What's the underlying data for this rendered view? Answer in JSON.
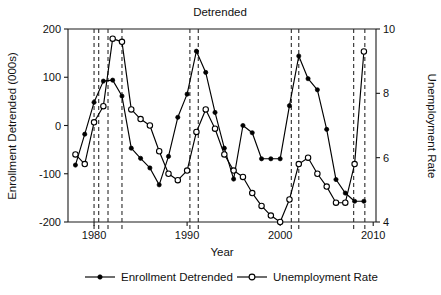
{
  "chart_data": {
    "type": "line",
    "title": "Detrended",
    "xlabel": "Year",
    "ylabel": "Enrollment Detrended (000s)",
    "y2label": "Unemployment Rate",
    "xlim": [
      1977.2,
      2010.3
    ],
    "ylim": [
      -200,
      200
    ],
    "y2lim": [
      4,
      10
    ],
    "grid": false,
    "legend_position": "below",
    "xticks": [
      1980,
      1990,
      2000,
      2010
    ],
    "xticklabels": [
      "1980",
      "1990",
      "2000",
      "2010"
    ],
    "yticks": [
      -200,
      -100,
      0,
      100,
      200
    ],
    "yticklabels": [
      "-200",
      "-100",
      "0",
      "100",
      "200"
    ],
    "y2ticks": [
      4,
      6,
      8,
      10
    ],
    "y2ticklabels": [
      "4",
      "6",
      "8",
      "10"
    ],
    "annotations": {
      "recession_lines_label": "recession markers (dashed vertical)",
      "recession_years": [
        1980.0,
        1980.5,
        1981.5,
        1983.0,
        1990.3,
        1991.2,
        2001.2,
        2002.0,
        2007.9,
        2009.1
      ]
    },
    "series": [
      {
        "name": "Enrollment Detrended",
        "axis": "left",
        "marker": "filled-circle",
        "x": [
          1978,
          1979,
          1980,
          1981,
          1982,
          1983,
          1984,
          1985,
          1986,
          1987,
          1988,
          1989,
          1990,
          1991,
          1992,
          1993,
          1994,
          1995,
          1996,
          1997,
          1998,
          1999,
          2000,
          2001,
          2002,
          2003,
          2004,
          2005,
          2006,
          2007,
          2008,
          2009
        ],
        "values": [
          -82,
          -18,
          48,
          92,
          94,
          61,
          -47,
          -68,
          -88,
          -123,
          -64,
          17,
          65,
          154,
          110,
          27,
          -47,
          -111,
          0,
          -15,
          -69,
          -69,
          -69,
          41,
          144,
          97,
          74,
          -8,
          -112,
          -140,
          -157,
          -157
        ]
      },
      {
        "name": "Unemployment Rate",
        "axis": "right",
        "marker": "open-circle",
        "x": [
          1978,
          1979,
          1980,
          1981,
          1982,
          1983,
          1984,
          1985,
          1986,
          1987,
          1988,
          1989,
          1990,
          1991,
          1992,
          1993,
          1994,
          1995,
          1996,
          1997,
          1998,
          1999,
          2000,
          2001,
          2002,
          2003,
          2004,
          2005,
          2006,
          2007,
          2008,
          2009
        ],
        "values": [
          6.1,
          5.8,
          7.1,
          7.6,
          9.7,
          9.6,
          7.5,
          7.2,
          7.0,
          6.2,
          5.5,
          5.3,
          5.6,
          6.8,
          7.5,
          6.9,
          6.1,
          5.6,
          5.4,
          4.9,
          4.5,
          4.2,
          4.0,
          4.7,
          5.8,
          6.0,
          5.5,
          5.1,
          4.6,
          4.6,
          5.8,
          9.3
        ]
      }
    ],
    "legend": [
      {
        "label": "Enrollment Detrended",
        "marker": "filled-circle"
      },
      {
        "label": "Unemployment Rate",
        "marker": "open-circle"
      }
    ]
  }
}
